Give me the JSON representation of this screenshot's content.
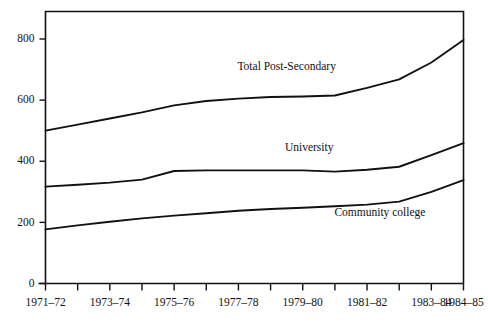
{
  "chart_data": {
    "type": "line",
    "title": "",
    "subtitle": "",
    "xlabel": "",
    "ylabel": "",
    "grid": false,
    "legend_position": "inline-annotations",
    "xlim": [
      1971,
      1984
    ],
    "ylim": [
      0,
      880
    ],
    "y_ticks": [
      0,
      200,
      400,
      600,
      800
    ],
    "y_tick_labels": [
      "0",
      "200",
      "400",
      "600",
      "800"
    ],
    "x": [
      1971,
      1972,
      1973,
      1974,
      1975,
      1976,
      1977,
      1978,
      1979,
      1980,
      1981,
      1982,
      1983,
      1984
    ],
    "x_tick_labels_all": [
      "1971–72",
      "1972–73",
      "1973–74",
      "1974–75",
      "1975–76",
      "1976–77",
      "1977–78",
      "1978–79",
      "1979–80",
      "1980–81",
      "1981–82",
      "1982–83",
      "1983–84",
      "1984–85"
    ],
    "x_tick_labels_shown": [
      {
        "x": 1971,
        "label": "1971–72"
      },
      {
        "x": 1973,
        "label": "1973–74"
      },
      {
        "x": 1975,
        "label": "1975–76"
      },
      {
        "x": 1977,
        "label": "1977–78"
      },
      {
        "x": 1979,
        "label": "1979–80"
      },
      {
        "x": 1981,
        "label": "1981–82"
      },
      {
        "x": 1983,
        "label": "1983–84"
      },
      {
        "x": 1984,
        "label": "1984–85"
      }
    ],
    "series": [
      {
        "name": "Total Post-Secondary",
        "label_x": 1978.5,
        "label_y": 700,
        "values": [
          500,
          520,
          540,
          560,
          583,
          597,
          605,
          610,
          612,
          615,
          640,
          668,
          723,
          797
        ]
      },
      {
        "name": "University",
        "label_x": 1979.2,
        "label_y": 432,
        "values": [
          317,
          323,
          330,
          340,
          368,
          370,
          370,
          370,
          370,
          366,
          372,
          382,
          420,
          459
        ]
      },
      {
        "name": "Community college",
        "label_x": 1981.4,
        "label_y": 222,
        "values": [
          177,
          190,
          202,
          213,
          222,
          230,
          238,
          244,
          248,
          253,
          258,
          268,
          300,
          338
        ]
      }
    ]
  }
}
